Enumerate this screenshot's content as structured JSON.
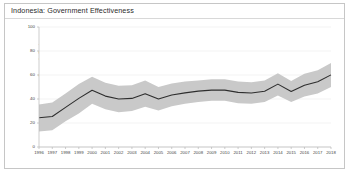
{
  "chart_title": "Indonesia: Government Effectiveness",
  "chart_data": {
    "type": "line",
    "title": "Indonesia: Government Effectiveness",
    "xlabel": "",
    "ylabel": "Percentile Rank",
    "ylim": [
      0,
      100
    ],
    "yticks": [
      0,
      20,
      40,
      60,
      80,
      100
    ],
    "grid": true,
    "legend": "none",
    "x": [
      1996,
      1997,
      1998,
      1999,
      2000,
      2001,
      2002,
      2003,
      2004,
      2005,
      2006,
      2007,
      2008,
      2009,
      2010,
      2011,
      2012,
      2013,
      2014,
      2015,
      2016,
      2017,
      2018
    ],
    "series": [
      {
        "name": "Percentile Rank",
        "values": [
          24.4,
          25.4,
          33.0,
          40.5,
          47.3,
          42.4,
          40.0,
          40.5,
          44.4,
          40.0,
          43.4,
          45.1,
          46.6,
          47.4,
          47.4,
          45.5,
          45.0,
          46.4,
          52.4,
          46.2,
          51.4,
          54.3,
          60.1
        ]
      }
    ],
    "confidence_band": {
      "name": "Confidence Interval",
      "lower": [
        13.0,
        14.0,
        21.5,
        28.0,
        36.0,
        31.5,
        29.0,
        30.0,
        33.5,
        30.5,
        34.0,
        36.0,
        37.5,
        38.5,
        38.5,
        36.5,
        36.0,
        37.5,
        43.0,
        37.5,
        42.0,
        44.5,
        50.0
      ],
      "upper": [
        35.5,
        37.0,
        44.5,
        52.5,
        58.5,
        53.5,
        51.0,
        51.5,
        55.5,
        50.0,
        53.0,
        54.5,
        55.5,
        56.5,
        56.5,
        54.5,
        54.0,
        55.5,
        61.5,
        55.0,
        61.0,
        64.0,
        70.0
      ]
    },
    "colors": {
      "line": "#2e2e2e",
      "band": "#c9c9c9",
      "grid": "#ebebeb",
      "axis": "#b8b8b8",
      "text": "#454545",
      "frame": "#c6c6c6"
    }
  }
}
